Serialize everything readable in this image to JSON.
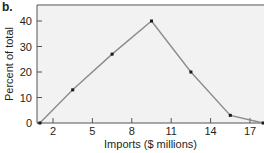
{
  "panel_label": "b.",
  "chart_data": {
    "type": "line",
    "title": "",
    "xlabel": "Imports ($ millions)",
    "ylabel": "Percent of total",
    "x": [
      1.0,
      3.5,
      6.5,
      9.5,
      12.5,
      15.5,
      18.0
    ],
    "series": [
      {
        "name": "Percent of total",
        "values": [
          0,
          13,
          27,
          40,
          20,
          3,
          0
        ]
      }
    ],
    "xticks": [
      2,
      5,
      8,
      11,
      14,
      17
    ],
    "yticks": [
      0,
      10,
      20,
      30,
      40
    ],
    "xlim": [
      0.7,
      18.2
    ],
    "ylim": [
      0,
      46
    ],
    "grid": false,
    "legend": null,
    "colors": {
      "line": "#8c8c8c",
      "marker": "#1a1a1a",
      "plot_background": "#f2f2f2",
      "frame": "#8c8c8c",
      "axis": "#555555"
    }
  }
}
